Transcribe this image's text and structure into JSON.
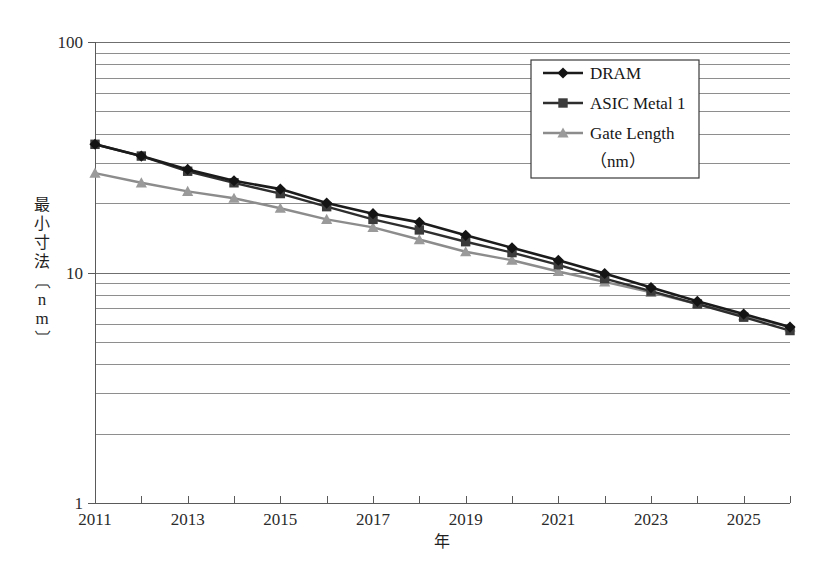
{
  "figure": {
    "background": "#ffffff",
    "plot_left_px": 95,
    "plot_right_px": 790,
    "plot_top_px": 42,
    "plot_bottom_px": 503
  },
  "axes": {
    "y": {
      "label": "最小寸法〔nm〕",
      "scale": "log",
      "range": [
        1,
        100
      ],
      "major_ticks": [
        "1",
        "10",
        "100"
      ],
      "minor_gridlines": [
        2,
        3,
        4,
        5,
        6,
        7,
        8,
        9,
        20,
        30,
        40,
        50,
        60,
        70,
        80,
        90
      ],
      "grid": true
    },
    "x": {
      "label": "年",
      "range": [
        2011,
        2026
      ],
      "tick_labels": [
        "2011",
        "2013",
        "2015",
        "2017",
        "2019",
        "2021",
        "2023",
        "2025"
      ],
      "tick_values": [
        2011,
        2013,
        2015,
        2017,
        2019,
        2021,
        2023,
        2025
      ],
      "minor_tick_values": [
        2012,
        2014,
        2016,
        2018,
        2020,
        2022,
        2024,
        2026
      ],
      "grid": false
    }
  },
  "legend": {
    "position": "top-right-inside",
    "entries": [
      {
        "label": "DRAM",
        "marker": "diamond",
        "color": "#141414"
      },
      {
        "label": "ASIC Metal 1",
        "marker": "square",
        "color": "#3b3b3b"
      },
      {
        "label": "Gate Length",
        "label2": "（nm）",
        "marker": "triangle",
        "color": "#9a9a9a"
      }
    ]
  },
  "chart_data": {
    "type": "line",
    "title": "",
    "xlabel": "年",
    "ylabel": "最小寸法〔nm〕",
    "yscale": "log",
    "ylim": [
      1,
      100
    ],
    "xlim": [
      2011,
      2026
    ],
    "grid": true,
    "legend_position": "upper right (inside plot)",
    "x": [
      2011,
      2012,
      2013,
      2014,
      2015,
      2016,
      2017,
      2018,
      2019,
      2020,
      2021,
      2022,
      2023,
      2024,
      2025,
      2026
    ],
    "series": [
      {
        "name": "DRAM",
        "marker": "diamond",
        "color": "#141414",
        "values": [
          36,
          32,
          28,
          25,
          23,
          20,
          18,
          16.5,
          14.5,
          12.8,
          11.3,
          9.9,
          8.6,
          7.5,
          6.6,
          5.8
        ]
      },
      {
        "name": "ASIC Metal 1",
        "marker": "square",
        "color": "#3b3b3b",
        "values": [
          36,
          32,
          27.5,
          24.5,
          22,
          19.3,
          17,
          15.3,
          13.6,
          12.2,
          10.8,
          9.4,
          8.3,
          7.3,
          6.4,
          5.6
        ]
      },
      {
        "name": "Gate Length (nm)",
        "marker": "triangle",
        "color": "#9a9a9a",
        "values": [
          27,
          24.5,
          22.5,
          21,
          19,
          17,
          15.7,
          13.9,
          12.3,
          11.3,
          10.1,
          9.1,
          8.2,
          7.3,
          6.5,
          5.8
        ]
      }
    ]
  }
}
